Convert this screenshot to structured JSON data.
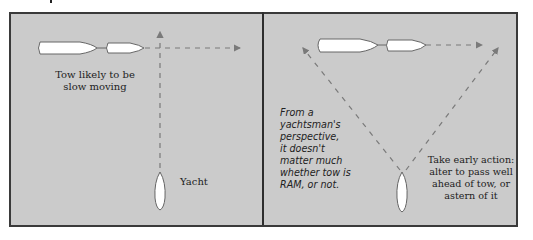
{
  "panels": [
    {
      "id": "left",
      "labels": {
        "tow": "Tow likely to be slow moving",
        "tow_line1": "Tow likely to be",
        "tow_line2": "slow moving",
        "yacht": "Yacht"
      }
    },
    {
      "id": "right",
      "labels": {
        "note_lines": [
          "From a",
          "yachtsman's",
          "perspective,",
          "it doesn't",
          "matter much",
          "whether tow is",
          "RAM, or not."
        ],
        "action_lines": [
          "Take early action:",
          "alter to pass well",
          "ahead of tow, or",
          "astern of it"
        ]
      }
    }
  ],
  "colors": {
    "background": "#cbcbcb",
    "border": "#3a3a3a",
    "vessel_fill": "#ffffff",
    "vessel_stroke": "#666666",
    "dash": "#7a7a7a"
  },
  "icons": {
    "tug": "vessel-hull-icon",
    "tow": "towed-vessel-icon",
    "yacht": "yacht-hull-icon",
    "arrow": "dashed-arrow-icon"
  }
}
